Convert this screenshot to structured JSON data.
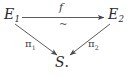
{
  "diagram": {
    "kind": "commutative-triangle",
    "background_color": "#ffffff",
    "ink_color": "#3a3a3a",
    "nodes": [
      {
        "id": "E1",
        "base": "E",
        "subscript": "1",
        "suffix": "",
        "position": "top-left"
      },
      {
        "id": "E2",
        "base": "E",
        "subscript": "2",
        "suffix": "",
        "position": "top-right"
      },
      {
        "id": "S",
        "base": "S",
        "subscript": "",
        "suffix": ".",
        "position": "bottom-center"
      }
    ],
    "arrows": [
      {
        "id": "f",
        "from": "E1",
        "to": "E2",
        "style": "solid",
        "label_above": "f",
        "label_below": "~",
        "label_below_meaning": "isomorphism"
      },
      {
        "id": "pi1",
        "from": "E1",
        "to": "S",
        "style": "solid",
        "label_base": "π",
        "label_subscript": "1"
      },
      {
        "id": "pi2",
        "from": "E2",
        "to": "S",
        "style": "solid",
        "label_base": "π",
        "label_subscript": "2"
      }
    ]
  }
}
